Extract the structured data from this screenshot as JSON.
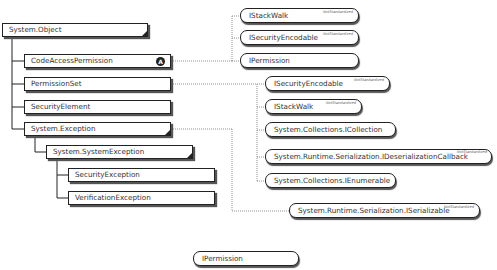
{
  "diagram": {
    "type": "class-hierarchy",
    "classes": [
      {
        "id": "system-object",
        "label": "System.Object"
      },
      {
        "id": "code-access-permission",
        "label": "CodeAccessPermission",
        "badge": "A"
      },
      {
        "id": "permission-set",
        "label": "PermissionSet"
      },
      {
        "id": "security-element",
        "label": "SecurityElement"
      },
      {
        "id": "system-exception",
        "label": "System.Exception"
      },
      {
        "id": "system-system-exception",
        "label": "System.SystemException"
      },
      {
        "id": "security-exception",
        "label": "SecurityException"
      },
      {
        "id": "verification-exception",
        "label": "VerificationException"
      }
    ],
    "interfaces": {
      "cap_istackwalk": {
        "label": "IStackWalk",
        "tag": "NotStandardized"
      },
      "cap_isecurityencodable": {
        "label": "ISecurityEncodable",
        "tag": "NotStandardized"
      },
      "cap_ipermission": {
        "label": "IPermission"
      },
      "ps_isecurityencodable": {
        "label": "ISecurityEncodable",
        "tag": "NotStandardized"
      },
      "ps_istackwalk": {
        "label": "IStackWalk",
        "tag": "NotStandardized"
      },
      "ps_icollection": {
        "label": "System.Collections.ICollection"
      },
      "ps_ideserializationcallback": {
        "label": "System.Runtime.Serialization.IDeserializationCallback",
        "tag": "NotStandardized"
      },
      "ps_ienumerable": {
        "label": "System.Collections.IEnumerable"
      },
      "ex_iserializable": {
        "label": "System.Runtime.Serialization.ISerializable",
        "tag": "NotStandardized"
      },
      "standalone_ipermission": {
        "label": "IPermission"
      }
    },
    "relations": [
      {
        "from": "code-access-permission",
        "implements": [
          "IStackWalk",
          "ISecurityEncodable",
          "IPermission"
        ]
      },
      {
        "from": "permission-set",
        "implements": [
          "ISecurityEncodable",
          "IStackWalk",
          "System.Collections.ICollection",
          "System.Runtime.Serialization.IDeserializationCallback",
          "System.Collections.IEnumerable"
        ]
      },
      {
        "from": "system-exception",
        "implements": [
          "System.Runtime.Serialization.ISerializable"
        ]
      }
    ]
  }
}
